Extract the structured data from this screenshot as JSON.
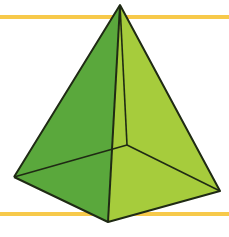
{
  "figure": {
    "background": "#ffffff",
    "guide_lines": [
      {
        "name": "top-guide-line",
        "y": 16,
        "color": "#f7c94a"
      },
      {
        "name": "bottom-guide-line",
        "y": 213,
        "color": "#f7c94a"
      }
    ],
    "vertices": {
      "apex": [
        120,
        5
      ],
      "left": [
        14,
        177
      ],
      "front_bottom": [
        108,
        222
      ],
      "right": [
        220,
        191
      ],
      "back_hidden": [
        127,
        145
      ]
    },
    "colors": {
      "left_face": "#5aa83c",
      "right_face": "#a6cc3c",
      "base_left": "#62ad40",
      "base_right": "#9cc63a",
      "edge": "#1f2a14"
    }
  }
}
